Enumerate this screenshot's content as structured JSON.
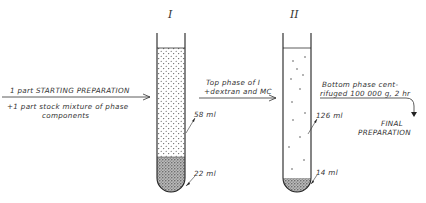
{
  "tubes": [
    {
      "roman": "I",
      "top_phase_volume": "58 ml",
      "bottom_phase_volume": "22 ml"
    },
    {
      "roman": "II",
      "top_phase_volume": "126 ml",
      "bottom_phase_volume": "14 ml"
    }
  ],
  "step1": {
    "line1": "1 part STARTING PREPARATION",
    "line2": "+1 part stock mixture of phase",
    "line3": "components"
  },
  "step2": {
    "line1": "Top phase of I",
    "line2": "+dextran and MC"
  },
  "step3": {
    "line1": "Bottom phase cent-",
    "line2": "rifuged 100 000 g, 2 hr"
  },
  "final": {
    "line1": "FINAL",
    "line2": "PREPARATION"
  }
}
